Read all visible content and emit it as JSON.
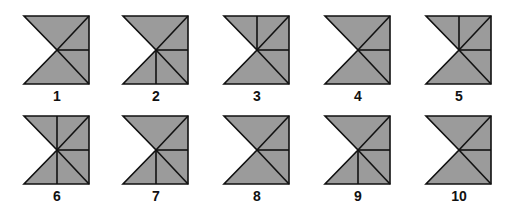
{
  "colors": {
    "fill": "#9b9b9b",
    "stroke": "#111111",
    "background": "#ffffff"
  },
  "figures": [
    {
      "label": "1",
      "left": 22,
      "top": 14,
      "variant": "none"
    },
    {
      "label": "2",
      "left": 121,
      "top": 14,
      "variant": "bottom"
    },
    {
      "label": "3",
      "left": 222,
      "top": 14,
      "variant": "top"
    },
    {
      "label": "4",
      "left": 323,
      "top": 14,
      "variant": "none"
    },
    {
      "label": "5",
      "left": 424,
      "top": 14,
      "variant": "top"
    },
    {
      "label": "6",
      "left": 22,
      "top": 114,
      "variant": "full"
    },
    {
      "label": "7",
      "left": 121,
      "top": 114,
      "variant": "bottom"
    },
    {
      "label": "8",
      "left": 222,
      "top": 114,
      "variant": "none"
    },
    {
      "label": "9",
      "left": 323,
      "top": 114,
      "variant": "bottom"
    },
    {
      "label": "10",
      "left": 424,
      "top": 114,
      "variant": "none"
    }
  ]
}
